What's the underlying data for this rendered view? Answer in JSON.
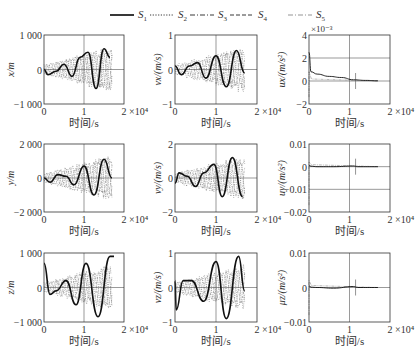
{
  "legend": [
    {
      "label": "S",
      "sub": "1",
      "style": "solid"
    },
    {
      "label": "S",
      "sub": "2",
      "style": "dotted"
    },
    {
      "label": "S",
      "sub": "3",
      "style": "dashdot"
    },
    {
      "label": "S",
      "sub": "4",
      "style": "dashed"
    },
    {
      "label": "S",
      "sub": "5",
      "style": "dashdot-light"
    }
  ],
  "chart_data": [
    {
      "type": "line",
      "panel": "x",
      "ylabel": "x/m",
      "xlabel": "时间/s",
      "ylim": [
        -1000,
        1000
      ],
      "yticks": [
        "1 000",
        "0",
        "-1 000"
      ],
      "xticks": [
        "0",
        "1",
        "2"
      ],
      "xscale_label": "×10⁴",
      "xlim": [
        0,
        20000
      ],
      "grid": true,
      "series": [
        {
          "name": "S1",
          "x": [
            0,
            1000,
            3000,
            5000,
            7000,
            9000,
            11000,
            13000,
            15000,
            16500
          ],
          "values": [
            0,
            -150,
            -50,
            150,
            -200,
            350,
            500,
            -550,
            600,
            350
          ]
        }
      ]
    },
    {
      "type": "line",
      "panel": "vx",
      "ylabel": "vx/(m/s)",
      "xlabel": "时间/s",
      "ylim": [
        -1,
        1
      ],
      "yticks": [
        "1",
        "0",
        "-1"
      ],
      "xticks": [
        "0",
        "1",
        "2"
      ],
      "xscale_label": "×10⁴",
      "xlim": [
        0,
        20000
      ],
      "grid": true,
      "series": [
        {
          "name": "S1",
          "x": [
            0,
            1500,
            3500,
            5500,
            7500,
            10000,
            12500,
            15000,
            17000
          ],
          "values": [
            0.1,
            -0.15,
            0.1,
            0.2,
            -0.25,
            0.4,
            -0.5,
            0.55,
            -0.1
          ]
        }
      ]
    },
    {
      "type": "line",
      "panel": "ux",
      "ylabel": "ux/(m/s²)",
      "xlabel": "时间/s",
      "ylim": [
        -2,
        4
      ],
      "yscale_label": "×10⁻³",
      "yticks": [
        "4",
        "2",
        "0",
        "-2"
      ],
      "xticks": [
        "0",
        "1",
        "2"
      ],
      "xscale_label": "×10⁴",
      "xlim": [
        0,
        20000
      ],
      "grid": true,
      "series": [
        {
          "name": "S1",
          "x": [
            0,
            500,
            2000,
            5000,
            8000,
            11000,
            14000,
            17000
          ],
          "values": [
            2.5,
            0.8,
            0.6,
            0.4,
            0.3,
            0.1,
            0.05,
            0.02
          ]
        }
      ]
    },
    {
      "type": "line",
      "panel": "y",
      "ylabel": "y/m",
      "xlabel": "时间/s",
      "ylim": [
        -2000,
        2000
      ],
      "yticks": [
        "2 000",
        "0",
        "-2 000"
      ],
      "xticks": [
        "0",
        "1",
        "2"
      ],
      "xscale_label": "×10⁴",
      "xlim": [
        0,
        20000
      ],
      "grid": true,
      "series": [
        {
          "name": "S1",
          "x": [
            0,
            1500,
            3500,
            5500,
            7500,
            10000,
            12500,
            15000,
            17000
          ],
          "values": [
            0,
            -250,
            200,
            100,
            -400,
            700,
            -1000,
            1100,
            0
          ]
        }
      ]
    },
    {
      "type": "line",
      "panel": "vy",
      "ylabel": "vy/(m/s)",
      "xlabel": "时间/s",
      "ylim": [
        -2,
        2
      ],
      "yticks": [
        "2",
        "0",
        "-2"
      ],
      "xticks": [
        "0",
        "1",
        "2"
      ],
      "xscale_label": "×10⁴",
      "xlim": [
        0,
        20000
      ],
      "grid": true,
      "series": [
        {
          "name": "S1",
          "x": [
            0,
            1000,
            3000,
            5000,
            7000,
            9500,
            11500,
            14000,
            16500
          ],
          "values": [
            -0.3,
            0.3,
            0.1,
            -0.5,
            0.3,
            0.8,
            -1.1,
            1.2,
            -1.1
          ]
        }
      ]
    },
    {
      "type": "line",
      "panel": "uy",
      "ylabel": "uy/(m/s²)",
      "xlabel": "时间/s",
      "ylim": [
        -0.02,
        0.01
      ],
      "yticks": [
        "0.01",
        "0",
        "-0.01",
        "-0.02"
      ],
      "xticks": [
        "0",
        "1",
        "2"
      ],
      "xscale_label": "×10⁴",
      "xlim": [
        0,
        20000
      ],
      "grid": true,
      "series": [
        {
          "name": "S1",
          "x": [
            0,
            500,
            2000,
            6000,
            11000,
            12000,
            17000
          ],
          "values": [
            0.0005,
            0.0002,
            0,
            0,
            0.0003,
            0,
            0
          ]
        }
      ]
    },
    {
      "type": "line",
      "panel": "z",
      "ylabel": "z/m",
      "xlabel": "时间/s",
      "ylim": [
        -1000,
        1000
      ],
      "yticks": [
        "1 000",
        "0",
        "-1 000"
      ],
      "xticks": [
        "0",
        "1",
        "2"
      ],
      "xscale_label": "×10⁴",
      "xlim": [
        0,
        20000
      ],
      "grid": true,
      "series": [
        {
          "name": "S1",
          "x": [
            0,
            1500,
            3000,
            5500,
            8000,
            10500,
            13500,
            16500,
            17500
          ],
          "values": [
            700,
            -200,
            -100,
            200,
            -500,
            700,
            -850,
            900,
            900
          ]
        }
      ]
    },
    {
      "type": "line",
      "panel": "vz",
      "ylabel": "vz/(m/s)",
      "xlabel": "时间/s",
      "ylim": [
        -1,
        1
      ],
      "yticks": [
        "1",
        "0",
        "-1"
      ],
      "xticks": [
        "0",
        "1",
        "2"
      ],
      "xscale_label": "×10⁴",
      "xlim": [
        0,
        20000
      ],
      "grid": true,
      "series": [
        {
          "name": "S1",
          "x": [
            0,
            300,
            2000,
            4000,
            7000,
            10000,
            12500,
            15500,
            17000
          ],
          "values": [
            0.2,
            -0.65,
            0.2,
            0.2,
            -0.4,
            0.75,
            -0.9,
            0.9,
            -0.1
          ]
        }
      ]
    },
    {
      "type": "line",
      "panel": "uz",
      "ylabel": "μz/(m/s²)",
      "xlabel": "时间/s",
      "ylim": [
        -0.01,
        0.01
      ],
      "yticks": [
        "0.01",
        "0",
        "-0.01"
      ],
      "xticks": [
        "0",
        "1",
        "2"
      ],
      "xscale_label": "×10⁴",
      "xlim": [
        0,
        20000
      ],
      "grid": true,
      "series": [
        {
          "name": "S1",
          "x": [
            0,
            500,
            2000,
            6000,
            11000,
            12000,
            17000
          ],
          "values": [
            0.0005,
            0.0001,
            0,
            -0.0002,
            0.0003,
            0,
            0
          ]
        }
      ]
    }
  ]
}
